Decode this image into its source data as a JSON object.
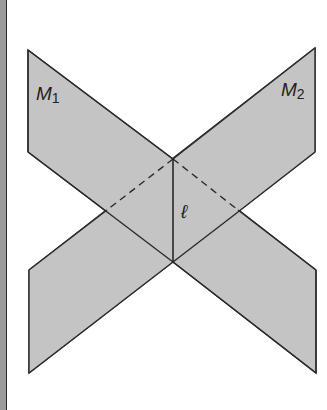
{
  "figure": {
    "planes": [
      {
        "name": "M1",
        "label": "M",
        "subscript": "1"
      },
      {
        "name": "M2",
        "label": "M",
        "subscript": "2"
      }
    ],
    "intersection_line": {
      "label": "ℓ"
    },
    "colors": {
      "plane_fill": "#c4c4c4",
      "edge": "#2b2b2b",
      "background": "#ffffff",
      "strip": "#9a9a9a"
    }
  }
}
